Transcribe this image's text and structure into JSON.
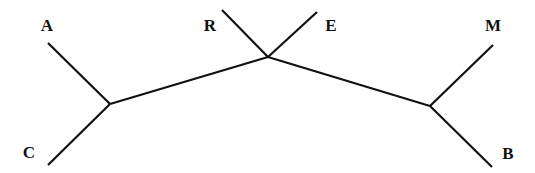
{
  "diagram": {
    "type": "unrooted-phylogenetic-tree",
    "nodes": [
      {
        "id": "n1",
        "x": 110,
        "y": 104
      },
      {
        "id": "n2",
        "x": 268,
        "y": 57
      },
      {
        "id": "n3",
        "x": 430,
        "y": 106
      }
    ],
    "leaves": [
      {
        "label": "A",
        "x": 48,
        "y": 43,
        "label_x": 47,
        "label_y": 31,
        "parent": "n1"
      },
      {
        "label": "C",
        "x": 48,
        "y": 165,
        "label_x": 29,
        "label_y": 158,
        "parent": "n1"
      },
      {
        "label": "R",
        "x": 222,
        "y": 10,
        "label_x": 210,
        "label_y": 31,
        "parent": "n2"
      },
      {
        "label": "E",
        "x": 317,
        "y": 12,
        "label_x": 331,
        "label_y": 31,
        "parent": "n2"
      },
      {
        "label": "M",
        "x": 493,
        "y": 45,
        "label_x": 493,
        "label_y": 31,
        "parent": "n3"
      },
      {
        "label": "B",
        "x": 492,
        "y": 167,
        "label_x": 508,
        "label_y": 159,
        "parent": "n3"
      }
    ],
    "internal_edges": [
      {
        "from": "n1",
        "to": "n2"
      },
      {
        "from": "n2",
        "to": "n3"
      }
    ],
    "line_color": "#111111",
    "label_color": "#111111"
  }
}
